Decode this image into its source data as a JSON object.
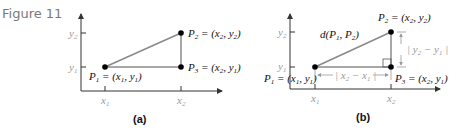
{
  "figure_label": "Figure 11",
  "panel_a": {
    "caption": "(a)",
    "x_ticks": [
      "x1",
      "x2"
    ],
    "y_ticks": [
      "y1",
      "y2"
    ],
    "points": {
      "P1": "P1 = (x1, y1)",
      "P2": "P2 = (x2, y2)",
      "P3": "P3 = (x2, y1)"
    }
  },
  "panel_b": {
    "caption": "(b)",
    "x_ticks": [
      "x1",
      "x2"
    ],
    "y_ticks": [
      "y1",
      "y2"
    ],
    "distance_label": "d(P1, P2)",
    "horizontal_label": "|x2 − x1|",
    "vertical_label": "|y2 − y1|",
    "points": {
      "P1": "P1 = (x1, y1)",
      "P2": "P2 = (x2, y2)",
      "P3": "P3 = (x2, y1)"
    }
  },
  "colors": {
    "axis": "#333333",
    "segment": "#8a8a8a",
    "point": "#000000",
    "gray_label": "#9a9a9a"
  }
}
